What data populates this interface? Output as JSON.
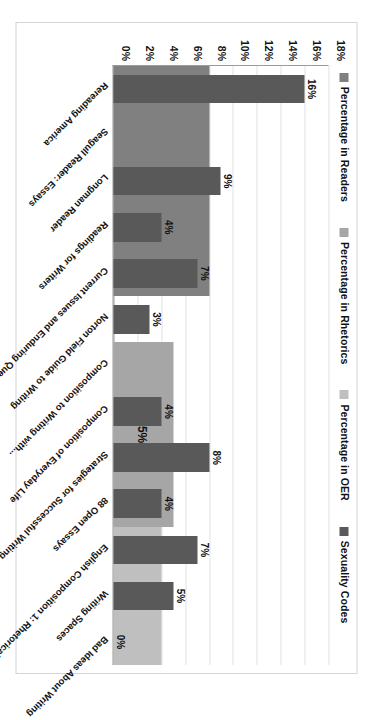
{
  "chart_data": {
    "type": "bar",
    "title": "",
    "xlabel": "",
    "ylabel": "",
    "ylim": [
      0,
      18
    ],
    "grid": true,
    "legend_position": "top",
    "ytick_labels": [
      "18%",
      "16%",
      "14%",
      "12%",
      "10%",
      "8%",
      "6%",
      "4%",
      "2%",
      "0%"
    ],
    "ytick_values": [
      18,
      16,
      14,
      12,
      10,
      8,
      6,
      4,
      2,
      0
    ],
    "legend": [
      {
        "label": "Percentage in Readers",
        "color": "#808080"
      },
      {
        "label": "Percentage in Rhetorics",
        "color": "#a6a6a6"
      },
      {
        "label": "Percentage in OER",
        "color": "#bfbfbf"
      },
      {
        "label": "Sexuality Codes",
        "color": "#595959"
      }
    ],
    "categories": [
      "Rereading America",
      "Seagull Reader: Essays",
      "Longman Reader",
      "Readings for Writers",
      "Current Issues and Enduring Questions",
      "Norton Field Guide to Writing",
      "Composition to Writing with...",
      "Composition of Everyday Life",
      "Strategies for Successful Writing",
      "88 Open Essays",
      "English Composition 1: Rhetorical...",
      "Writing Spaces",
      "Bad Ideas About Writing"
    ],
    "series": [
      {
        "name": "Sexuality Codes",
        "color": "#595959",
        "values": [
          16,
          null,
          9,
          4,
          7,
          3,
          null,
          4,
          8,
          4,
          7,
          5,
          0
        ],
        "labels": [
          "16%",
          "",
          "9%",
          "4%",
          "7%",
          "3%",
          "",
          "4%",
          "8%",
          "4%",
          "7%",
          "5%",
          "0%"
        ]
      }
    ],
    "groups": [
      {
        "name": "Percentage in Readers",
        "color": "#808080",
        "value": 8,
        "label": "8%",
        "start_category": "Rereading America",
        "end_category": "Current Issues and Enduring Questions"
      },
      {
        "name": "Percentage in Rhetorics",
        "color": "#a6a6a6",
        "value": 5,
        "label": "5%",
        "start_category": "Composition to Writing with...",
        "end_category": "88 Open Essays"
      },
      {
        "name": "Percentage in OER",
        "color": "#bfbfbf",
        "value": 4,
        "label": "4%",
        "start_category": "English Composition 1: Rhetorical...",
        "end_category": "Bad Ideas About Writing"
      }
    ]
  }
}
